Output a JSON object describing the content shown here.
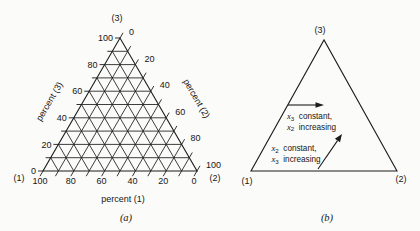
{
  "figure": {
    "background": "#fbfbf9",
    "ink": "#1c1c1c",
    "diagram_a": {
      "corner_top": "(3)",
      "corner_bottom_left": "(1)",
      "corner_bottom_right": "(2)",
      "axis_left_label": "percent (3)",
      "axis_right_label": "percent (2)",
      "axis_bottom_label": "percent (1)",
      "left_tick_labels": [
        "100",
        "80",
        "60",
        "40",
        "20",
        "0"
      ],
      "right_tick_labels": [
        "0",
        "20",
        "40",
        "60",
        "80",
        "100"
      ],
      "bottom_tick_labels": [
        "100",
        "80",
        "60",
        "40",
        "20",
        "0"
      ],
      "grid_step_percent": 10,
      "label_step_percent": 20,
      "caption": "(a)"
    },
    "diagram_b": {
      "corner_top": "(3)",
      "corner_bottom_left": "(1)",
      "corner_bottom_right": "(2)",
      "annotations": [
        {
          "line1_var": "x",
          "line1_sub": "3",
          "line1_text": "constant,",
          "line2_var": "x",
          "line2_sub": "2",
          "line2_text": "increasing",
          "arrow": "horizontal-right"
        },
        {
          "line1_var": "x",
          "line1_sub": "2",
          "line1_text": "constant,",
          "line2_var": "x",
          "line2_sub": "3",
          "line2_text": "increasing",
          "arrow": "up-right"
        }
      ],
      "caption": "(b)"
    }
  }
}
